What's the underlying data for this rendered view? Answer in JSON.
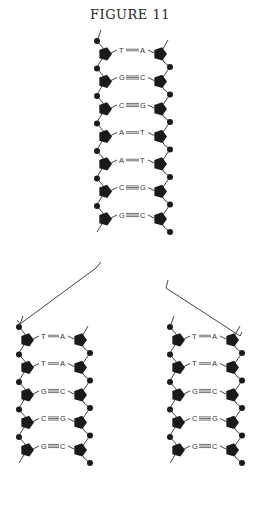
{
  "figure": {
    "title": "FIGURE 11",
    "parent_helix": {
      "pairs": [
        {
          "left": "T",
          "right": "A",
          "bonds": 2
        },
        {
          "left": "G",
          "right": "C",
          "bonds": 3
        },
        {
          "left": "C",
          "right": "G",
          "bonds": 3
        },
        {
          "left": "A",
          "right": "T",
          "bonds": 2
        },
        {
          "left": "A",
          "right": "T",
          "bonds": 2
        },
        {
          "left": "C",
          "right": "G",
          "bonds": 3
        },
        {
          "left": "G",
          "right": "C",
          "bonds": 3
        }
      ]
    },
    "daughter_left": {
      "pairs": [
        {
          "left": "T",
          "right": "A",
          "bonds": 2
        },
        {
          "left": "T",
          "right": "A",
          "bonds": 2
        },
        {
          "left": "G",
          "right": "C",
          "bonds": 3
        },
        {
          "left": "C",
          "right": "G",
          "bonds": 3
        },
        {
          "left": "G",
          "right": "C",
          "bonds": 3
        }
      ]
    },
    "daughter_right": {
      "pairs": [
        {
          "left": "T",
          "right": "A",
          "bonds": 2
        },
        {
          "left": "T",
          "right": "A",
          "bonds": 2
        },
        {
          "left": "G",
          "right": "C",
          "bonds": 3
        },
        {
          "left": "C",
          "right": "G",
          "bonds": 3
        },
        {
          "left": "G",
          "right": "C",
          "bonds": 3
        }
      ]
    },
    "colors": {
      "ink": "#1a1a1a",
      "line": "#444444",
      "background": "#ffffff"
    }
  }
}
